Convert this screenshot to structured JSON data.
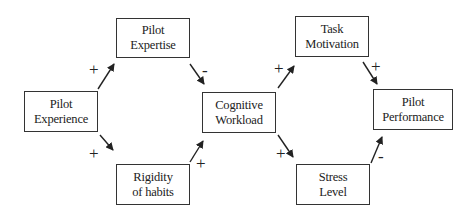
{
  "diagram": {
    "type": "causal-loop",
    "nodes": [
      {
        "id": "pilot_experience",
        "line1": "Pilot",
        "line2": "Experience"
      },
      {
        "id": "pilot_expertise",
        "line1": "Pilot",
        "line2": "Expertise"
      },
      {
        "id": "rigidity_of_habits",
        "line1": "Rigidity",
        "line2": "of habits"
      },
      {
        "id": "cognitive_workload",
        "line1": "Cognitive",
        "line2": "Workload"
      },
      {
        "id": "task_motivation",
        "line1": "Task",
        "line2": "Motivation"
      },
      {
        "id": "stress_level",
        "line1": "Stress",
        "line2": "Level"
      },
      {
        "id": "pilot_performance",
        "line1": "Pilot",
        "line2": "Performance"
      }
    ],
    "edges": [
      {
        "from": "pilot_experience",
        "to": "pilot_expertise",
        "sign": "+"
      },
      {
        "from": "pilot_experience",
        "to": "rigidity_of_habits",
        "sign": "+"
      },
      {
        "from": "pilot_expertise",
        "to": "cognitive_workload",
        "sign": "-"
      },
      {
        "from": "rigidity_of_habits",
        "to": "cognitive_workload",
        "sign": "+"
      },
      {
        "from": "cognitive_workload",
        "to": "task_motivation",
        "sign": "+"
      },
      {
        "from": "cognitive_workload",
        "to": "stress_level",
        "sign": "+"
      },
      {
        "from": "task_motivation",
        "to": "pilot_performance",
        "sign": "+"
      },
      {
        "from": "stress_level",
        "to": "pilot_performance",
        "sign": "-"
      }
    ]
  }
}
